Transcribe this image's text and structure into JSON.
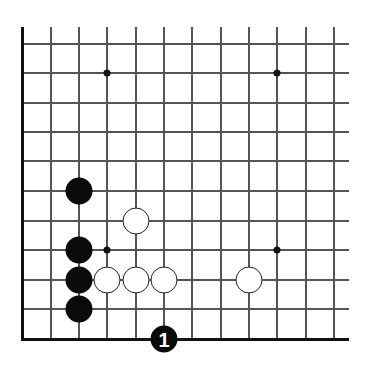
{
  "diagram": {
    "type": "go-board-corner",
    "grid": {
      "columns_x": [
        22,
        51,
        79,
        107,
        136,
        164,
        192,
        221,
        249,
        277,
        306,
        334
      ],
      "rows_y": [
        44,
        73,
        103,
        132,
        161,
        191,
        221,
        250,
        280,
        309,
        339
      ],
      "line_top": 27,
      "line_right": 349,
      "left_edge_x": 22,
      "bottom_edge_y": 339
    },
    "star_points": [
      {
        "x": 107,
        "y": 73
      },
      {
        "x": 277,
        "y": 73
      },
      {
        "x": 107,
        "y": 250
      },
      {
        "x": 277,
        "y": 250
      }
    ],
    "stones": [
      {
        "color": "black",
        "x": 79,
        "y": 191,
        "label": ""
      },
      {
        "color": "black",
        "x": 79,
        "y": 250,
        "label": ""
      },
      {
        "color": "black",
        "x": 79,
        "y": 280,
        "label": ""
      },
      {
        "color": "black",
        "x": 79,
        "y": 309,
        "label": ""
      },
      {
        "color": "white",
        "x": 136,
        "y": 221,
        "label": ""
      },
      {
        "color": "white",
        "x": 107,
        "y": 280,
        "label": ""
      },
      {
        "color": "white",
        "x": 136,
        "y": 280,
        "label": ""
      },
      {
        "color": "white",
        "x": 164,
        "y": 280,
        "label": ""
      },
      {
        "color": "white",
        "x": 249,
        "y": 280,
        "label": ""
      },
      {
        "color": "black",
        "x": 164,
        "y": 339,
        "label": "1"
      }
    ],
    "colors": {
      "line": "#555555",
      "edge": "#111111",
      "black_stone": "#0a0a0a",
      "white_stone": "#ffffff",
      "white_outline": "#222222"
    }
  }
}
